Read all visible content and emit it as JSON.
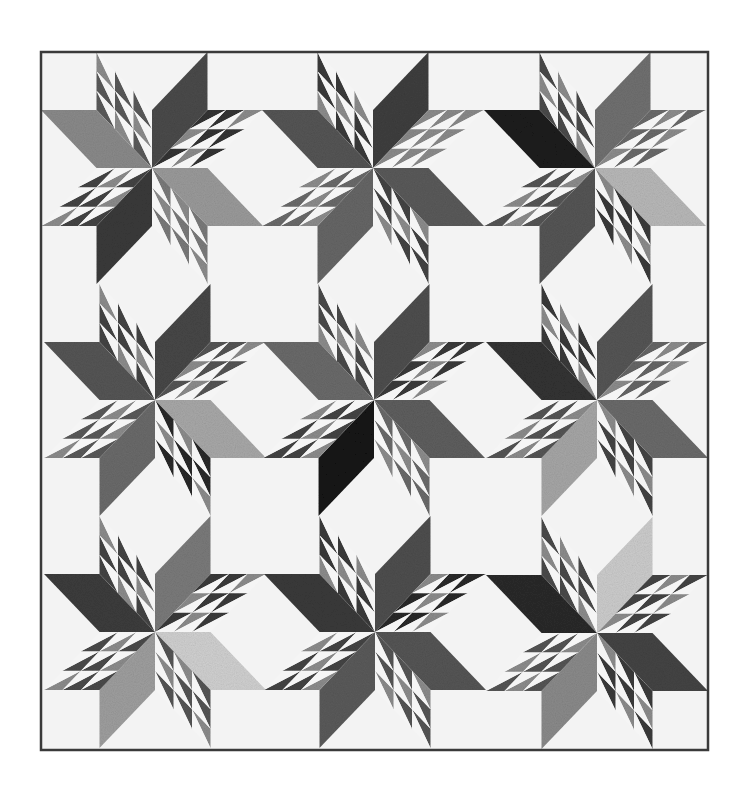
{
  "image": {
    "subject": "Black-and-white LeMoyne star quilt with half-square-triangle points",
    "background": "#ffffff",
    "quilt_background": "#f3f3f3",
    "binding_color": "#3a3a3a"
  },
  "quilt": {
    "x": 41,
    "y": 52,
    "width": 667,
    "height": 698,
    "binding_width": 2.5,
    "cell_a": 55.5,
    "cell_b": 58,
    "hst_divisions": 3,
    "hst_white": "#f5f5f5",
    "stars": [
      {
        "id": "star-r1-c1",
        "cx": 152,
        "cy": 168,
        "colors": {
          "up": "#4a4a4a",
          "right": "#9a9a9a",
          "down": "#3a3a3a",
          "left": "#8a8a8a"
        },
        "hst_tones": [
          "#5a5a5a",
          "#333333",
          "#7a7a7a",
          "#444444"
        ]
      },
      {
        "id": "star-r1-c2",
        "cx": 373,
        "cy": 168,
        "colors": {
          "up": "#3e3e3e",
          "right": "#5a5a5a",
          "down": "#666666",
          "left": "#555555"
        },
        "hst_tones": [
          "#3a3a3a",
          "#8a8a8a",
          "#444444",
          "#6a6a6a"
        ]
      },
      {
        "id": "star-r1-c3",
        "cx": 595,
        "cy": 168,
        "colors": {
          "up": "#707070",
          "right": "#b8b8b8",
          "down": "#555555",
          "left": "#1c1c1c"
        },
        "hst_tones": [
          "#4a4a4a",
          "#6a6a6a",
          "#3a3a3a",
          "#555555"
        ]
      },
      {
        "id": "star-r2-c1",
        "cx": 155,
        "cy": 400,
        "colors": {
          "up": "#474747",
          "right": "#a8a8a8",
          "down": "#6a6a6a",
          "left": "#555555"
        },
        "hst_tones": [
          "#444444",
          "#555555",
          "#2a2a2a",
          "#5a5a5a"
        ]
      },
      {
        "id": "star-r2-c2",
        "cx": 374,
        "cy": 400,
        "colors": {
          "up": "#4e4e4e",
          "right": "#5e5e5e",
          "down": "#141414",
          "left": "#6a6a6a"
        },
        "hst_tones": [
          "#4a4a4a",
          "#3a3a3a",
          "#6a6a6a",
          "#444444"
        ]
      },
      {
        "id": "star-r2-c3",
        "cx": 597,
        "cy": 400,
        "colors": {
          "up": "#555555",
          "right": "#6a6a6a",
          "down": "#a6a6a6",
          "left": "#333333"
        },
        "hst_tones": [
          "#3a3a3a",
          "#666666",
          "#444444",
          "#555555"
        ]
      },
      {
        "id": "star-r3-c1",
        "cx": 155,
        "cy": 632,
        "colors": {
          "up": "#7a7a7a",
          "right": "#d0d0d0",
          "down": "#9e9e9e",
          "left": "#3c3c3c"
        },
        "hst_tones": [
          "#444444",
          "#3a3a3a",
          "#555555",
          "#4a4a4a"
        ]
      },
      {
        "id": "star-r3-c2",
        "cx": 375,
        "cy": 632,
        "colors": {
          "up": "#4e4e4e",
          "right": "#555555",
          "down": "#5a5a5a",
          "left": "#3a3a3a"
        },
        "hst_tones": [
          "#3a3a3a",
          "#2a2a2a",
          "#555555",
          "#444444"
        ]
      },
      {
        "id": "star-r3-c3",
        "cx": 597,
        "cy": 633,
        "colors": {
          "up": "#cccccc",
          "right": "#444444",
          "down": "#8a8a8a",
          "left": "#2a2a2a"
        },
        "hst_tones": [
          "#4a4a4a",
          "#444444",
          "#3a3a3a",
          "#555555"
        ]
      }
    ]
  }
}
